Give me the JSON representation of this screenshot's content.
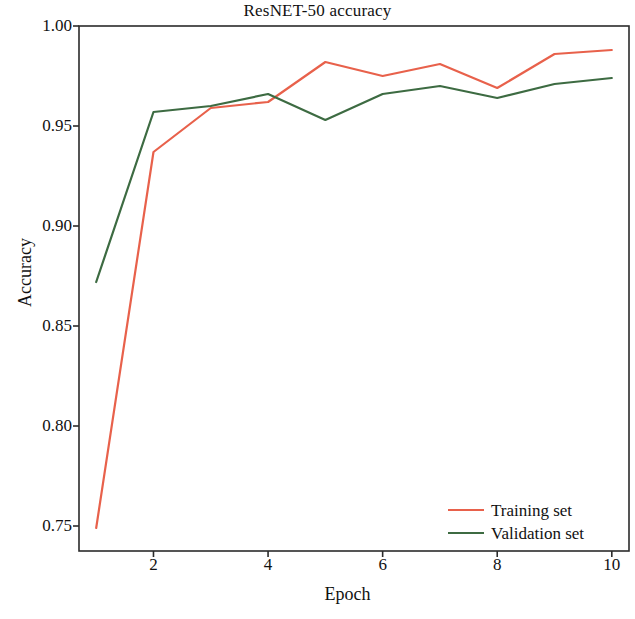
{
  "chart_data": {
    "type": "line",
    "title": "ResNET-50 accuracy",
    "xlabel": "Epoch",
    "ylabel": "Accuracy",
    "x": [
      1,
      2,
      3,
      4,
      5,
      6,
      7,
      8,
      9,
      10
    ],
    "xlim": [
      0.7,
      10.3
    ],
    "ylim": [
      0.7375,
      1.0
    ],
    "xticks": [
      2,
      4,
      6,
      8,
      10
    ],
    "xtick_labels": [
      "2",
      "4",
      "6",
      "8",
      "10"
    ],
    "yticks": [
      0.75,
      0.8,
      0.85,
      0.9,
      0.95,
      1.0
    ],
    "ytick_labels": [
      "0.75",
      "0.80",
      "0.85",
      "0.90",
      "0.95",
      "1.00"
    ],
    "grid": false,
    "legend_position": "lower right",
    "series": [
      {
        "name": "Training set",
        "color": "#e8614b",
        "values": [
          0.749,
          0.937,
          0.959,
          0.962,
          0.982,
          0.975,
          0.981,
          0.969,
          0.986,
          0.988
        ]
      },
      {
        "name": "Validation set",
        "color": "#3d6b42",
        "values": [
          0.872,
          0.957,
          0.96,
          0.966,
          0.953,
          0.966,
          0.97,
          0.964,
          0.971,
          0.974
        ]
      }
    ]
  },
  "axes": {
    "frame_color": "#2b2b2b"
  }
}
